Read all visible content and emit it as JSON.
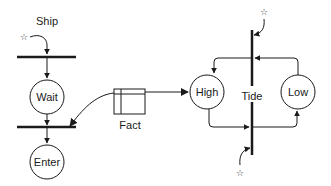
{
  "diagram": {
    "type": "petri-net",
    "colors": {
      "ink": "#1a1a1a",
      "background": "#ffffff"
    },
    "labels": {
      "ship": "Ship",
      "fact": "Fact",
      "tide": "Tide"
    },
    "places": [
      {
        "id": "wait",
        "label": "Wait"
      },
      {
        "id": "enter",
        "label": "Enter"
      },
      {
        "id": "high",
        "label": "High"
      },
      {
        "id": "low",
        "label": "Low"
      }
    ],
    "markers": {
      "star_glyph": "☆"
    }
  }
}
